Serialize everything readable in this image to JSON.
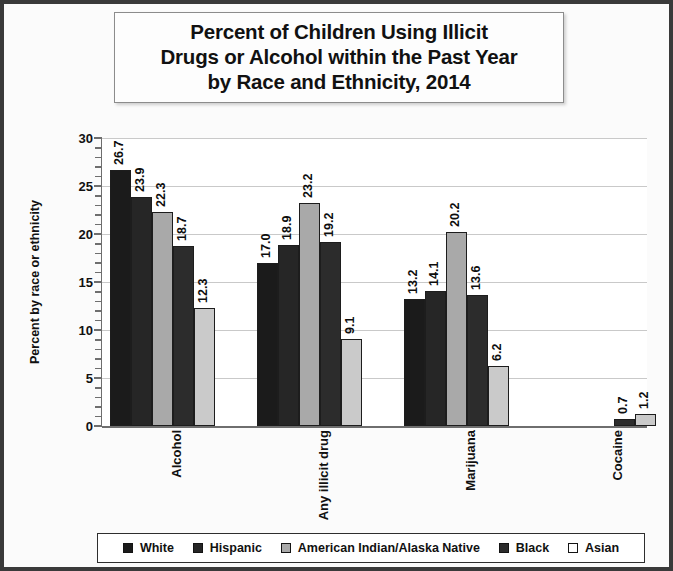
{
  "chart_data": {
    "type": "bar",
    "title": "Percent of Children Using Illicit Drugs or Alcohol within the Past Year by Race and Ethnicity, 2014",
    "title_lines": [
      "Percent of Children Using Illicit",
      "Drugs or Alcohol within the Past Year",
      "by Race and Ethnicity, 2014"
    ],
    "xlabel": "",
    "ylabel": "Percent by race or ethnicity",
    "ylim": [
      0,
      30
    ],
    "yticks": [
      0,
      5,
      10,
      15,
      20,
      25,
      30
    ],
    "grid": "horizontal",
    "legend_position": "bottom",
    "categories": [
      "Alcohol",
      "Any illicit drug",
      "Marijuana",
      "Cocaine"
    ],
    "series": [
      {
        "name": "White",
        "color": "#1b1b1b",
        "values": [
          26.7,
          17.0,
          13.2,
          null
        ],
        "labels": [
          "26.7",
          "17.0",
          "13.2",
          ""
        ]
      },
      {
        "name": "Hispanic",
        "color": "#262626",
        "values": [
          23.9,
          18.9,
          14.1,
          null
        ],
        "labels": [
          "23.9",
          "18.9",
          "14.1",
          ""
        ]
      },
      {
        "name": "American Indian/Alaska Native",
        "color": "#a9a9a9",
        "values": [
          22.3,
          23.2,
          20.2,
          null
        ],
        "labels": [
          "22.3",
          "23.2",
          "20.2",
          ""
        ]
      },
      {
        "name": "Black",
        "color": "#2c2c2c",
        "values": [
          18.7,
          19.2,
          13.6,
          0.7
        ],
        "labels": [
          "18.7",
          "19.2",
          "13.6",
          "0.7"
        ]
      },
      {
        "name": "Asian",
        "color": "#cacaca",
        "values": [
          12.3,
          9.1,
          6.2,
          1.2
        ],
        "labels": [
          "12.3",
          "9.1",
          "6.2",
          "1.2"
        ]
      }
    ]
  },
  "legend": {
    "items": [
      {
        "label": "White"
      },
      {
        "label": "Hispanic"
      },
      {
        "label": "American Indian/Alaska Native"
      },
      {
        "label": "Black"
      },
      {
        "label": "Asian"
      }
    ]
  }
}
